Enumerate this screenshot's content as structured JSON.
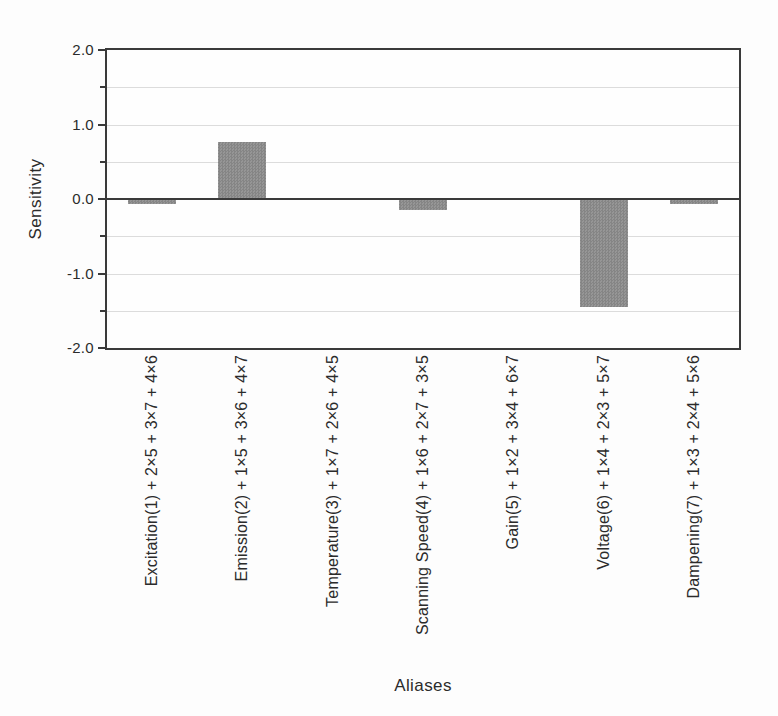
{
  "chart_data": {
    "type": "bar",
    "title": "",
    "xlabel": "Aliases",
    "ylabel": "Sensitivity",
    "ylim": [
      -2.0,
      2.0
    ],
    "grid": true,
    "legend": "none",
    "categories": [
      "Excitation(1) + 2×5 + 3×7 + 4×6",
      "Emission(2) + 1×5 + 3×6 + 4×7",
      "Temperature(3) + 1×7 + 2×6 + 4×5",
      "Scanning Speed(4) + 1×6 + 2×7 + 3×5",
      "Gain(5) + 1×2 + 3×4 + 6×7",
      "Voltage(6) + 1×4 + 2×3 + 5×7",
      "Dampening(7) + 1×3 + 2×4 + 5×6"
    ],
    "values": [
      -0.07,
      0.76,
      0.0,
      -0.15,
      0.0,
      -1.45,
      -0.07
    ],
    "yticks": [
      {
        "v": 2.0,
        "label": "2.0"
      },
      {
        "v": 1.0,
        "label": "1.0"
      },
      {
        "v": 0.0,
        "label": "0.0"
      },
      {
        "v": -1.0,
        "label": "-1.0"
      },
      {
        "v": -2.0,
        "label": "-2.0"
      }
    ],
    "yticks_minor": [
      1.5,
      0.5,
      -0.5,
      -1.5
    ],
    "gridlines": [
      1.5,
      1.0,
      0.5,
      -0.5,
      -1.0,
      -1.5
    ],
    "colors": {
      "bar": "#8d8d8d",
      "axis": "#3a3a3a",
      "grid": "#dcdcdc",
      "text": "#2b2b2b",
      "background": "#fdfdfd"
    }
  }
}
